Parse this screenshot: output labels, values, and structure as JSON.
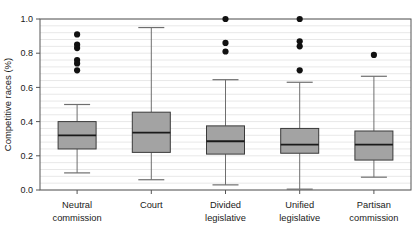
{
  "figure": {
    "title": "",
    "background_color": "#ffffff"
  },
  "chart_data": {
    "type": "box",
    "title": "",
    "subtitle": "",
    "xlabel": "",
    "ylabel": "Competitive races (%)",
    "ylim": [
      0.0,
      1.0
    ],
    "yticks": [
      0.0,
      0.2,
      0.4,
      0.6,
      0.8,
      1.0
    ],
    "ytick_labels": [
      "0.0",
      "0.2",
      "0.4",
      "0.6",
      "0.8",
      "1.0"
    ],
    "grid": "horizontal-minor",
    "grid_minor_step": 0.04,
    "legend": "none",
    "categories": [
      "Neutral commission",
      "Court",
      "Divided legislative",
      "Unified legislative",
      "Partisan commission"
    ],
    "category_lines": [
      [
        "Neutral",
        "commission"
      ],
      [
        "Court",
        ""
      ],
      [
        "Divided",
        "legislative"
      ],
      [
        "Unified",
        "legislative"
      ],
      [
        "Partisan",
        "commission"
      ]
    ],
    "colors": {
      "box_fill": "#a3a3a3",
      "box_edge": "#3a3a3a",
      "median": "#1a1a1a",
      "whisker": "#6e6e6e",
      "outlier": "#111111",
      "grid": "#e8e8e8",
      "axis": "#555555"
    },
    "boxes": [
      {
        "category": "Neutral commission",
        "whisker_low": 0.1,
        "q1": 0.24,
        "median": 0.32,
        "q3": 0.4,
        "whisker_high": 0.5,
        "outliers": [
          0.91,
          0.85,
          0.83,
          0.76,
          0.74,
          0.7
        ]
      },
      {
        "category": "Court",
        "whisker_low": 0.06,
        "q1": 0.22,
        "median": 0.335,
        "q3": 0.455,
        "whisker_high": 0.95,
        "outliers": []
      },
      {
        "category": "Divided legislative",
        "whisker_low": 0.03,
        "q1": 0.21,
        "median": 0.285,
        "q3": 0.375,
        "whisker_high": 0.645,
        "outliers": [
          1.0,
          0.86,
          0.81
        ]
      },
      {
        "category": "Unified legislative",
        "whisker_low": 0.005,
        "q1": 0.215,
        "median": 0.265,
        "q3": 0.36,
        "whisker_high": 0.63,
        "outliers": [
          1.0,
          0.87,
          0.84,
          0.7
        ]
      },
      {
        "category": "Partisan commission",
        "whisker_low": 0.075,
        "q1": 0.175,
        "median": 0.265,
        "q3": 0.345,
        "whisker_high": 0.665,
        "outliers": [
          0.79
        ]
      }
    ]
  },
  "layout": {
    "plot_left": 40,
    "plot_right": 411,
    "plot_top": 19,
    "plot_bottom": 190,
    "box_width": 38,
    "cap_width": 26,
    "outlier_radius": 3.1
  }
}
